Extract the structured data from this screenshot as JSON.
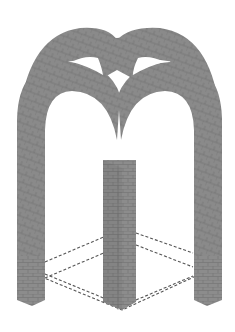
{
  "figure": {
    "title": "",
    "colors": {
      "background": "#ffffff",
      "stone": "#8a8a8a",
      "stone_dark": "#6e6e6e",
      "joint": "#5a5a5a",
      "dash": "#555555"
    }
  }
}
